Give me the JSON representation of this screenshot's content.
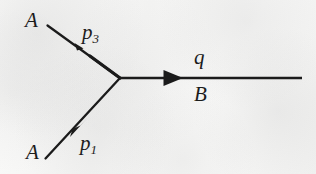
{
  "figure": {
    "type": "feynman-diagram",
    "ink_color": "#1b1b1b",
    "paper_color": "#f6f6f5",
    "labels": {
      "a_top": "A",
      "a_bottom": "A",
      "p3_symbol": "p",
      "p3_subscript": "3",
      "p1_symbol": "p",
      "p1_subscript": "1",
      "q": "q",
      "b": "B"
    },
    "lines": [
      {
        "name": "upper-left-leg",
        "from": [
          47,
          25
        ],
        "to": [
          120,
          78
        ],
        "arrow_at": [
          74,
          45
        ],
        "arrow_direction": "up-left",
        "label": "p3",
        "endpoint_label": "A"
      },
      {
        "name": "lower-left-leg",
        "from": [
          45,
          158
        ],
        "to": [
          120,
          78
        ],
        "arrow_at": [
          79,
          127
        ],
        "arrow_direction": "up-right",
        "label": "p1",
        "endpoint_label": "A"
      },
      {
        "name": "right-horizontal-leg",
        "from": [
          120,
          78
        ],
        "to": [
          302,
          78
        ],
        "arrow_at": [
          172,
          78
        ],
        "arrow_direction": "right",
        "label_above": "q",
        "label_below": "B"
      }
    ],
    "vertex": [
      120,
      78
    ]
  }
}
